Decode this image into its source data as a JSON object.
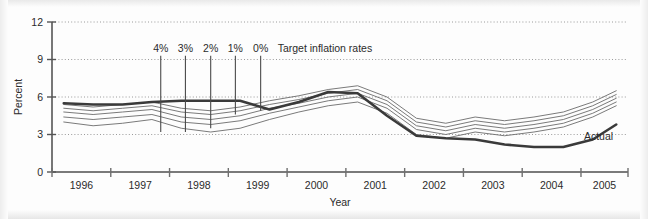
{
  "chart_data": {
    "type": "line",
    "title": "",
    "xlabel": "Year",
    "ylabel": "Percent",
    "xlim": [
      1995.5,
      2005.3
    ],
    "ylim": [
      0,
      12
    ],
    "yticks": [
      0,
      3,
      6,
      9,
      12
    ],
    "ytick_labels": [
      "0",
      "3",
      "6",
      "9",
      "12"
    ],
    "xticks": [
      1995.5,
      1996.5,
      1997.5,
      1998.5,
      1999.5,
      2000.5,
      2001.5,
      2002.5,
      2003.5,
      2004.5,
      2005.3
    ],
    "xtick_labels": [
      "1996",
      "1997",
      "1998",
      "1999",
      "2000",
      "2001",
      "2002",
      "2003",
      "2004",
      "2005"
    ],
    "grid": "horizontal-dotted",
    "gridlines_at": [
      3,
      6,
      9,
      12
    ],
    "legend_position": "inline-right",
    "x": [
      1995.7,
      1996.2,
      1996.7,
      1997.2,
      1997.7,
      1998.2,
      1998.7,
      1999.2,
      1999.7,
      2000.2,
      2000.7,
      2001.2,
      2001.7,
      2002.2,
      2002.7,
      2003.2,
      2003.7,
      2004.2,
      2004.7,
      2005.1
    ],
    "series": [
      {
        "name": "Actual",
        "label": "Actual",
        "style": "thick-solid",
        "color": "#3a3a3a",
        "width": 2.6,
        "values": [
          5.5,
          5.4,
          5.4,
          5.6,
          5.7,
          5.7,
          5.7,
          5.0,
          5.6,
          6.4,
          6.3,
          4.5,
          2.9,
          2.7,
          2.6,
          2.2,
          2.0,
          2.0,
          2.6,
          3.8
        ]
      },
      {
        "name": "Target 4%",
        "label": "4%",
        "style": "thin-solid",
        "color": "#6b6b6b",
        "width": 0.9,
        "values": [
          5.4,
          5.2,
          5.4,
          5.6,
          5.1,
          4.9,
          5.2,
          5.7,
          6.1,
          6.6,
          6.9,
          6.0,
          4.3,
          3.9,
          4.4,
          4.1,
          4.4,
          4.8,
          5.6,
          6.5
        ]
      },
      {
        "name": "Target 3%",
        "label": "3%",
        "style": "thin-solid",
        "color": "#6b6b6b",
        "width": 0.9,
        "values": [
          5.1,
          4.9,
          5.1,
          5.3,
          4.8,
          4.6,
          4.9,
          5.4,
          5.8,
          6.3,
          6.6,
          5.7,
          4.0,
          3.6,
          4.1,
          3.8,
          4.1,
          4.5,
          5.3,
          6.2
        ]
      },
      {
        "name": "Target 2%",
        "label": "2%",
        "style": "thin-solid",
        "color": "#6b6b6b",
        "width": 0.9,
        "values": [
          4.8,
          4.6,
          4.8,
          5.0,
          4.4,
          4.2,
          4.5,
          5.1,
          5.5,
          6.0,
          6.3,
          5.4,
          3.7,
          3.3,
          3.8,
          3.5,
          3.8,
          4.2,
          5.0,
          5.9
        ]
      },
      {
        "name": "Target 1%",
        "label": "1%",
        "style": "thin-solid",
        "color": "#6b6b6b",
        "width": 0.9,
        "values": [
          4.4,
          4.2,
          4.4,
          4.6,
          4.0,
          3.8,
          4.1,
          4.7,
          5.2,
          5.7,
          6.0,
          5.1,
          3.4,
          3.0,
          3.5,
          3.2,
          3.5,
          3.9,
          4.7,
          5.6
        ]
      },
      {
        "name": "Target 0%",
        "label": "0%",
        "style": "thin-solid",
        "color": "#6b6b6b",
        "width": 0.9,
        "values": [
          4.0,
          3.7,
          3.9,
          4.2,
          3.5,
          3.2,
          3.5,
          4.2,
          4.8,
          5.3,
          5.6,
          4.7,
          3.0,
          2.7,
          3.2,
          2.9,
          3.2,
          3.6,
          4.4,
          5.3
        ]
      }
    ],
    "annotations": {
      "target_group_label": "Target inflation rates",
      "target_markers": [
        {
          "label": "4%",
          "x": 1997.35,
          "y_top": 9.3,
          "y_bottom": 3.2
        },
        {
          "label": "3%",
          "x": 1997.77,
          "y_top": 9.3,
          "y_bottom": 3.2
        },
        {
          "label": "2%",
          "x": 1998.2,
          "y_top": 9.3,
          "y_bottom": 3.5
        },
        {
          "label": "1%",
          "x": 1998.62,
          "y_top": 9.3,
          "y_bottom": 4.6
        },
        {
          "label": "0%",
          "x": 1999.05,
          "y_top": 9.3,
          "y_bottom": 4.9
        }
      ],
      "actual_label": "Actual",
      "actual_label_x": 2004.55,
      "actual_label_y": 2.55
    }
  }
}
